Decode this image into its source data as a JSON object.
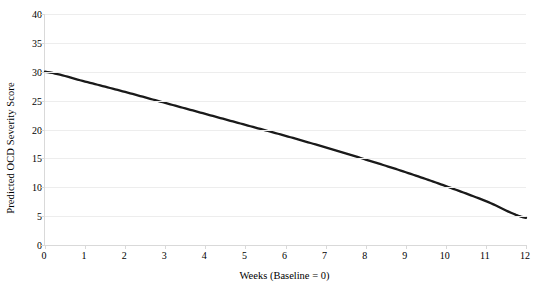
{
  "chart_data": {
    "type": "line",
    "title": "",
    "subtitle": "",
    "xlabel": "Weeks (Baseline = 0)",
    "ylabel": "Predicted OCD Severity Score",
    "xlim": [
      0,
      12
    ],
    "ylim": [
      0,
      40
    ],
    "xticks": [
      0,
      1,
      2,
      3,
      4,
      5,
      6,
      7,
      8,
      9,
      10,
      11,
      12
    ],
    "yticks": [
      0,
      5,
      10,
      15,
      20,
      25,
      30,
      35,
      40
    ],
    "xtick_labels": [
      "0",
      "1",
      "2",
      "3",
      "4",
      "5",
      "6",
      "7",
      "8",
      "9",
      "10",
      "11",
      "12"
    ],
    "ytick_labels": [
      "0",
      "5",
      "10",
      "15",
      "20",
      "25",
      "30",
      "35",
      "40"
    ],
    "grid": true,
    "grid_axis": "y",
    "legend": false,
    "legend_position": "none",
    "x": [
      0,
      1,
      2,
      3,
      4,
      5,
      6,
      7,
      8,
      9,
      10,
      11,
      12
    ],
    "series": [
      {
        "name": "Predicted OCD Severity Score",
        "color": "#1a1a1a",
        "line_width": 2.3,
        "markers": false,
        "values": [
          30.0,
          28.3,
          26.5,
          24.6,
          22.7,
          20.8,
          18.9,
          16.9,
          14.8,
          12.6,
          10.2,
          7.6,
          4.7
        ]
      }
    ],
    "annotations": []
  },
  "colors": {
    "background": "#ffffff",
    "series_line": "#1a1a1a",
    "gridline": "#ededed",
    "axis_line": "#d9d9d9",
    "text": "#000000"
  }
}
